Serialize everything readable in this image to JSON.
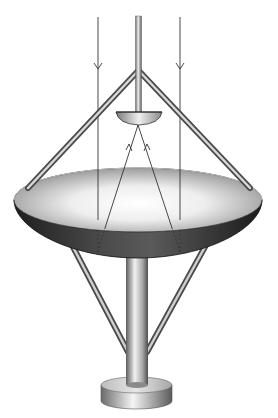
{
  "diagram": {
    "title": "Cassegrain parabolic dish antenna",
    "components": [
      {
        "id": "main-reflector",
        "label": "Parabolic main reflector"
      },
      {
        "id": "subreflector",
        "label": "Subreflector"
      },
      {
        "id": "feed-mast",
        "label": "Feed mast"
      },
      {
        "id": "upper-struts",
        "label": "Subreflector support struts"
      },
      {
        "id": "lower-struts",
        "label": "Dish support struts"
      },
      {
        "id": "pedestal",
        "label": "Pedestal pole"
      },
      {
        "id": "base",
        "label": "Base"
      },
      {
        "id": "incoming-rays",
        "label": "Incoming parallel rays"
      },
      {
        "id": "reflected-rays",
        "label": "Rays reflected to subreflector"
      }
    ],
    "colors": {
      "background": "#ffffff",
      "ray": "#333333",
      "metal_light": "#e8e8e8",
      "metal_mid": "#9a9a9a",
      "metal_dark": "#3a3a3a",
      "dish_inner_light": "#f4f4f4",
      "dish_inner_dark": "#8a8a8a",
      "dish_outer_dark": "#2e2e2e"
    },
    "rays": {
      "incoming_x": [
        98,
        180
      ],
      "arrow_direction_incoming": "down",
      "arrow_direction_reflected": "up"
    }
  }
}
